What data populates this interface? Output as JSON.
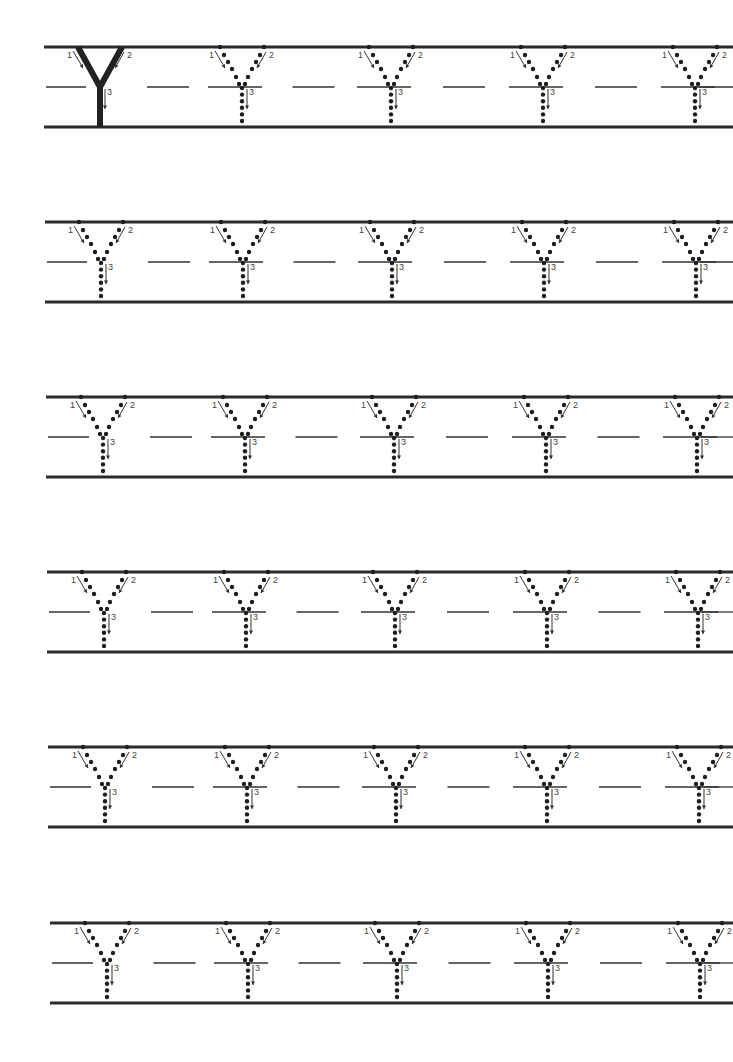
{
  "worksheet": {
    "title": "Letter Y tracing practice",
    "letter": "Y",
    "stroke_labels": [
      "1",
      "2",
      "3"
    ],
    "colors": {
      "ink": "#222222",
      "rule": "#2b2b2b",
      "paper": "#ffffff"
    },
    "letter_height": 80,
    "rows": [
      {
        "top": 47,
        "left": 44,
        "right": 733,
        "stems": [
          100,
          242,
          391,
          543,
          695
        ],
        "solid_first": true
      },
      {
        "top": 222,
        "left": 45,
        "right": 733,
        "stems": [
          101,
          243,
          392,
          544,
          696
        ],
        "solid_first": false
      },
      {
        "top": 397,
        "left": 46,
        "right": 733,
        "stems": [
          103,
          245,
          394,
          546,
          697
        ],
        "solid_first": false
      },
      {
        "top": 572,
        "left": 47,
        "right": 733,
        "stems": [
          104,
          246,
          395,
          547,
          698
        ],
        "solid_first": false
      },
      {
        "top": 747,
        "left": 48,
        "right": 733,
        "stems": [
          105,
          247,
          396,
          547,
          699
        ],
        "solid_first": false
      },
      {
        "top": 923,
        "left": 50,
        "right": 733,
        "stems": [
          107,
          248,
          397,
          548,
          700
        ],
        "solid_first": false
      }
    ]
  }
}
